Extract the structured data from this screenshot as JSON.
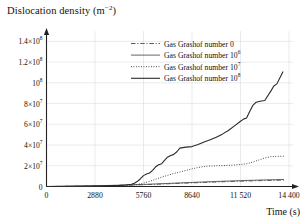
{
  "chart_data": {
    "type": "line",
    "title_base": "Dislocation density (m",
    "title_sup": "−2",
    "title_tail": ")",
    "xlabel": "Time (s)",
    "ylabel": "Dislocation density (m−2)",
    "xlim": [
      0,
      14400
    ],
    "ylim": [
      0,
      150000000
    ],
    "grid": true,
    "legend_position": "top-right-inside",
    "xticks": [
      {
        "value": 0,
        "label": "0"
      },
      {
        "value": 2880,
        "label": "2880"
      },
      {
        "value": 5760,
        "label": "5760"
      },
      {
        "value": 8640,
        "label": "8640"
      },
      {
        "value": 11520,
        "label": "11 520"
      },
      {
        "value": 14400,
        "label": "14 400"
      }
    ],
    "yticks": [
      {
        "value": 0,
        "base": "0",
        "sup": ""
      },
      {
        "value": 20000000,
        "base": "2×10",
        "sup": "7"
      },
      {
        "value": 40000000,
        "base": "4×10",
        "sup": "7"
      },
      {
        "value": 60000000,
        "base": "6×10",
        "sup": "7"
      },
      {
        "value": 80000000,
        "base": "8×10",
        "sup": "7"
      },
      {
        "value": 100000000,
        "base": "10",
        "sup": "8"
      },
      {
        "value": 120000000,
        "base": "1.2×10",
        "sup": "8"
      },
      {
        "value": 140000000,
        "base": "1.4×10",
        "sup": "8"
      }
    ],
    "series": [
      {
        "name": "Gas Grashof number 0",
        "legend_base": "Gas Grashof number 0",
        "legend_sup": "",
        "style": "dashdot",
        "color": "#4a4a4a",
        "width": 0.9,
        "x": [
          0,
          720,
          1440,
          2160,
          2880,
          3600,
          4320,
          5040,
          5760,
          6480,
          7200,
          7920,
          8640,
          9360,
          10080,
          10800,
          11520,
          12240,
          12960,
          13680,
          14100
        ],
        "y": [
          0,
          100000,
          250000,
          420000,
          620000,
          850000,
          1100000,
          1400000,
          1750000,
          2150000,
          2600000,
          3050000,
          3500000,
          3950000,
          4350000,
          4750000,
          5100000,
          5450000,
          5750000,
          6000000,
          6150000
        ]
      },
      {
        "name": "Gas Grashof number 10^6",
        "legend_base": "Gas Grashof number 10",
        "legend_sup": "6",
        "style": "solid",
        "color": "#555555",
        "width": 0.9,
        "x": [
          0,
          720,
          1440,
          2160,
          2880,
          3600,
          4320,
          5040,
          5760,
          6480,
          7200,
          7920,
          8640,
          9360,
          10080,
          10800,
          11520,
          12240,
          12960,
          13680,
          14100
        ],
        "y": [
          0,
          120000,
          290000,
          480000,
          700000,
          960000,
          1250000,
          1600000,
          2000000,
          2450000,
          2950000,
          3450000,
          3950000,
          4400000,
          4850000,
          5250000,
          5650000,
          6000000,
          6350000,
          6600000,
          6800000
        ]
      },
      {
        "name": "Gas Grashof number 10^7",
        "legend_base": "Gas Grashof number 10",
        "legend_sup": "7",
        "style": "dotted",
        "color": "#3a3a3a",
        "width": 1.0,
        "x": [
          0,
          1440,
          2880,
          4320,
          5040,
          5400,
          5760,
          6120,
          6480,
          6840,
          7200,
          7560,
          7920,
          8280,
          8640,
          9000,
          9360,
          9720,
          10080,
          10440,
          10800,
          11160,
          11520,
          11880,
          12240,
          12600,
          12960,
          13320,
          13680,
          14100
        ],
        "y": [
          0,
          150000,
          400000,
          900000,
          1400000,
          2000000,
          3200000,
          5000000,
          7000000,
          9000000,
          10800000,
          12500000,
          14000000,
          15500000,
          17000000,
          18300000,
          19300000,
          19800000,
          20000000,
          20200000,
          20400000,
          20800000,
          21200000,
          22000000,
          23500000,
          25500000,
          27500000,
          28800000,
          29100000,
          29200000
        ]
      },
      {
        "name": "Gas Grashof number 10^8",
        "legend_base": "Gas Grashof number 10",
        "legend_sup": "8",
        "style": "solid",
        "color": "#2a2a2a",
        "width": 1.1,
        "x": [
          0,
          1440,
          2880,
          4320,
          4680,
          5040,
          5220,
          5400,
          5580,
          5760,
          5940,
          6120,
          6300,
          6480,
          6660,
          6840,
          7020,
          7200,
          7380,
          7560,
          7740,
          7920,
          8280,
          8640,
          9000,
          9360,
          9720,
          10080,
          10440,
          10800,
          11160,
          11520,
          11700,
          11880,
          12060,
          12240,
          12420,
          12600,
          12960,
          13320,
          13500,
          13680,
          13860,
          14050
        ],
        "y": [
          0,
          180000,
          500000,
          1100000,
          1500000,
          2200000,
          3200000,
          5000000,
          7500000,
          10500000,
          12000000,
          13000000,
          15500000,
          19000000,
          21000000,
          22000000,
          25500000,
          28500000,
          30000000,
          31000000,
          33500000,
          37000000,
          38000000,
          38500000,
          40500000,
          43000000,
          45000000,
          47500000,
          50500000,
          54000000,
          58500000,
          63000000,
          65000000,
          66000000,
          72000000,
          78000000,
          81000000,
          82000000,
          83000000,
          92000000,
          97000000,
          99000000,
          105000000,
          111000000
        ]
      }
    ]
  },
  "axes": {
    "y_axis_name": "y-axis",
    "x_axis_name": "x-axis"
  }
}
